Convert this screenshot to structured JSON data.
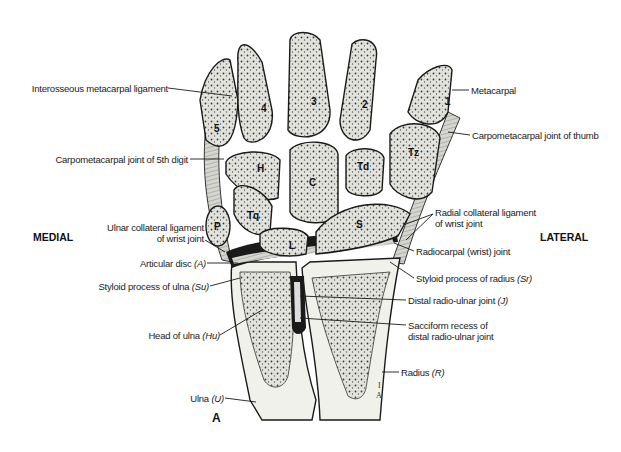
{
  "figure": {
    "panel_letter": "A",
    "orientation": {
      "left": "MEDIAL",
      "right": "LATERAL"
    },
    "colors": {
      "bone_fill": "#e9e9e4",
      "cartilage": "#cfcfc8",
      "outline": "#1a1a1a",
      "ligament": "#8a8a85",
      "background": "#ffffff"
    }
  },
  "bones": {
    "metacarpals": [
      "1",
      "2",
      "3",
      "4",
      "5"
    ],
    "carpals": {
      "hamate": "H",
      "capitate": "C",
      "trapezoid": "Td",
      "trapezium": "Tz",
      "triquetrum": "Tq",
      "pisiform": "P",
      "lunate": "L",
      "scaphoid": "S"
    },
    "artist_initials": [
      "I",
      "A"
    ]
  },
  "labels_left": {
    "interosseous": "Interosseous metacarpal ligament",
    "cmc5": "Carpometacarpal joint of 5th digit",
    "ulnar_collateral_1": "Ulnar collateral ligament",
    "ulnar_collateral_2": "of wrist joint",
    "articular_disc": "Articular disc ",
    "articular_disc_abbr": "(A)",
    "styloid_ulna": "Styloid process of ulna ",
    "styloid_ulna_abbr": "(Su)",
    "head_ulna": "Head of ulna ",
    "head_ulna_abbr": "(Hu)",
    "ulna": "Ulna ",
    "ulna_abbr": "(U)"
  },
  "labels_right": {
    "metacarpal": "Metacarpal",
    "cmc_thumb": "Carpometacarpal joint of thumb",
    "radial_collateral_1": "Radial collateral ligament",
    "radial_collateral_2": "of wrist joint",
    "radiocarpal": "Radiocarpal (wrist) joint",
    "styloid_radius": "Styloid process of radius ",
    "styloid_radius_abbr": "(Sr)",
    "distal_radioulnar": "Distal radio-ulnar joint ",
    "distal_radioulnar_abbr": "(J)",
    "sacciform_1": "Sacciform recess of",
    "sacciform_2": "distal radio-ulnar joint",
    "radius": "Radius ",
    "radius_abbr": "(R)"
  }
}
